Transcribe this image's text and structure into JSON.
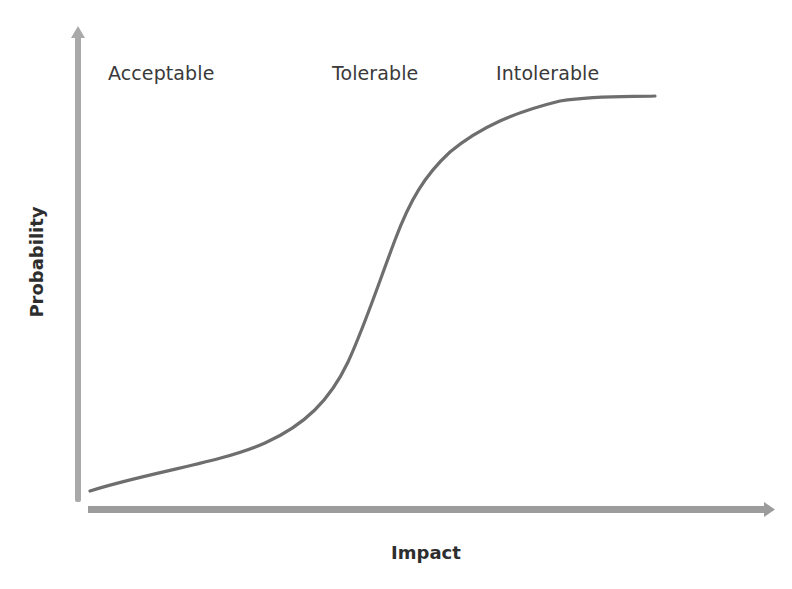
{
  "diagram": {
    "type": "risk-tolerance-curve",
    "zones": [
      {
        "label": "Acceptable",
        "x": 108
      },
      {
        "label": "Tolerable",
        "x": 332
      },
      {
        "label": "Intolerable",
        "x": 496
      }
    ],
    "axes": {
      "x": {
        "label": "Impact"
      },
      "y": {
        "label": "Probability"
      }
    },
    "curve": {
      "description": "S-shaped curve rising from low-probability at low impact to high-probability at high impact",
      "points_px": [
        [
          90,
          491
        ],
        [
          260,
          445
        ],
        [
          320,
          405
        ],
        [
          350,
          360
        ],
        [
          380,
          290
        ],
        [
          410,
          210
        ],
        [
          440,
          160
        ],
        [
          490,
          125
        ],
        [
          550,
          103
        ],
        [
          655,
          96
        ]
      ]
    },
    "colors": {
      "background": "#ffffff",
      "y_axis": "#a9a9a9",
      "x_axis": "#9c9c9c",
      "curve": "#6e6e6e",
      "text": "#333333"
    }
  }
}
